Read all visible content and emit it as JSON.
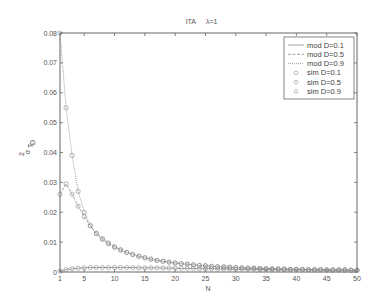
{
  "chart_data": {
    "type": "line",
    "xlabel": "N",
    "ylabel": "σ² T_D",
    "xlim": [
      1,
      50
    ],
    "ylim": [
      0,
      0.08
    ],
    "xticks": [
      1,
      5,
      10,
      15,
      20,
      25,
      30,
      35,
      40,
      45,
      50
    ],
    "yticks": [
      0,
      0.01,
      0.02,
      0.03,
      0.04,
      0.05,
      0.06,
      0.07,
      0.08
    ],
    "ytick_labels": [
      "0",
      "0.01",
      "0.02",
      "0.03",
      "0.04",
      "0.05",
      "0.06",
      "0.07",
      "0.08"
    ],
    "grid": false,
    "legend_position": "upper right",
    "legend": [
      "mod D=0.1",
      "mod D=0.5",
      "mod D=0.9",
      "sim D=0.1",
      "sim D=0.5",
      "sim D=0.9"
    ],
    "x": [
      1,
      2,
      3,
      4,
      5,
      6,
      7,
      8,
      9,
      10,
      11,
      12,
      13,
      14,
      15,
      16,
      17,
      18,
      19,
      20,
      21,
      22,
      23,
      24,
      25,
      26,
      27,
      28,
      29,
      30,
      31,
      32,
      33,
      34,
      35,
      36,
      37,
      38,
      39,
      40,
      41,
      42,
      43,
      44,
      45,
      46,
      47,
      48,
      49,
      50
    ],
    "series": [
      {
        "name": "D=0.1",
        "style": "model line + sim circles",
        "values": [
          0.0003,
          0.0008,
          0.0011,
          0.0013,
          0.0014,
          0.0015,
          0.0015,
          0.0015,
          0.0015,
          0.0015,
          0.0015,
          0.0015,
          0.0015,
          0.0014,
          0.0014,
          0.0014,
          0.0014,
          0.0013,
          0.0013,
          0.0013,
          0.0012,
          0.0012,
          0.0012,
          0.0011,
          0.0011,
          0.0011,
          0.001,
          0.001,
          0.001,
          0.0009,
          0.0009,
          0.0009,
          0.0009,
          0.0008,
          0.0008,
          0.0008,
          0.0008,
          0.0007,
          0.0007,
          0.0007,
          0.0007,
          0.0007,
          0.0006,
          0.0006,
          0.0006,
          0.0006,
          0.0006,
          0.0006,
          0.0005,
          0.0005
        ]
      },
      {
        "name": "D=0.5",
        "style": "model line + sim circles",
        "values": [
          0.026,
          0.0295,
          0.026,
          0.022,
          0.0185,
          0.0155,
          0.013,
          0.0112,
          0.0097,
          0.0085,
          0.0075,
          0.0066,
          0.0059,
          0.0053,
          0.0048,
          0.0043,
          0.0039,
          0.0036,
          0.0033,
          0.003,
          0.0028,
          0.0026,
          0.0024,
          0.0022,
          0.0021,
          0.0019,
          0.0018,
          0.0017,
          0.0016,
          0.0015,
          0.0014,
          0.0013,
          0.0013,
          0.0012,
          0.0011,
          0.0011,
          0.001,
          0.001,
          0.0009,
          0.0009,
          0.0009,
          0.0008,
          0.0008,
          0.0008,
          0.0007,
          0.0007,
          0.0007,
          0.0007,
          0.0006,
          0.0006
        ]
      },
      {
        "name": "D=0.9",
        "style": "model line + sim circles",
        "values": [
          0.08,
          0.055,
          0.039,
          0.027,
          0.02,
          0.0155,
          0.0128,
          0.0109,
          0.0094,
          0.0082,
          0.0073,
          0.0065,
          0.0058,
          0.0052,
          0.0047,
          0.0043,
          0.0039,
          0.0036,
          0.0033,
          0.003,
          0.0028,
          0.0026,
          0.0024,
          0.0022,
          0.0021,
          0.0019,
          0.0018,
          0.0017,
          0.0016,
          0.0015,
          0.0014,
          0.0013,
          0.0013,
          0.0012,
          0.0011,
          0.0011,
          0.001,
          0.001,
          0.0009,
          0.0009,
          0.0009,
          0.0008,
          0.0008,
          0.0008,
          0.0007,
          0.0007,
          0.0007,
          0.0007,
          0.0006,
          0.0006
        ]
      }
    ]
  },
  "plot": {
    "title_left": "ITA",
    "title_right": "λ=1",
    "xlabel": "N",
    "ylabel_main": "σ",
    "ylabel_sup": "2",
    "ylabel_sub": "T",
    "ylabel_subsub": "D"
  },
  "colors": {
    "axis": "#666666",
    "line": "#8a8a8a",
    "marker": "#8a8a8a",
    "text": "#555555"
  }
}
